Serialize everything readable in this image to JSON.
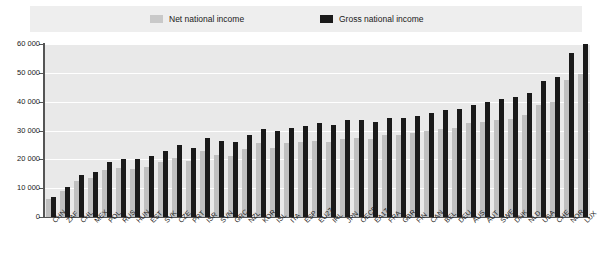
{
  "legend": {
    "entries": [
      {
        "label": "Net national income",
        "color": "#c9c9c9",
        "key": "net"
      },
      {
        "label": "Gross national income",
        "color": "#1a1a1a",
        "key": "gross"
      }
    ]
  },
  "axis": {
    "y_tick_labels": [
      "60 000",
      "50 000",
      "40 000",
      "30 000",
      "20 000",
      "10 000",
      "0"
    ]
  },
  "chart_data": {
    "type": "bar",
    "title": "",
    "subtitle": "",
    "xlabel": "",
    "ylabel": "",
    "ylim": [
      0,
      60000
    ],
    "ytick_values": [
      0,
      10000,
      20000,
      30000,
      40000,
      50000,
      60000
    ],
    "grid": true,
    "legend_position": "top",
    "grouping": "grouped",
    "categories": [
      "CHN",
      "ZAF",
      "CHL",
      "MEX",
      "POL",
      "RUS",
      "HUN",
      "EST",
      "SVK",
      "CZE",
      "PRT",
      "ISR",
      "SVN",
      "GRC",
      "NZL",
      "KOR",
      "ISL",
      "ITA",
      "ESP",
      "EU27",
      "IRL",
      "JPN",
      "OECD",
      "EA17",
      "FRA",
      "GBR",
      "FIN",
      "CAN",
      "BEL",
      "DEU",
      "AUS",
      "AUT",
      "SWE",
      "DNK",
      "NLD",
      "USA",
      "CHE",
      "NOR",
      "LUX"
    ],
    "series": [
      {
        "name": "Net national income",
        "color": "#c0c0c0",
        "values": [
          6200,
          9000,
          12500,
          13500,
          16200,
          17000,
          16500,
          17500,
          19000,
          20500,
          19500,
          23000,
          21500,
          21000,
          23500,
          25500,
          24000,
          25500,
          26000,
          26500,
          26000,
          27000,
          27500,
          27000,
          28500,
          28500,
          29000,
          30000,
          30500,
          31000,
          32500,
          33000,
          33500,
          34000,
          35500,
          39000,
          40000,
          47500,
          49500
        ]
      },
      {
        "name": "Gross national income",
        "color": "#1a1a1a",
        "values": [
          7000,
          10500,
          14500,
          15500,
          19000,
          20000,
          20000,
          21000,
          23000,
          25000,
          24000,
          27500,
          26500,
          26000,
          28500,
          30500,
          30000,
          31000,
          31500,
          32500,
          32000,
          33500,
          33500,
          33000,
          34500,
          34500,
          35000,
          36000,
          37000,
          37500,
          39000,
          40000,
          41000,
          41500,
          43000,
          47000,
          48500,
          57000,
          60000
        ]
      }
    ]
  }
}
